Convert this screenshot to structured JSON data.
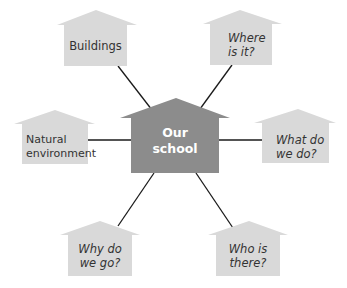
{
  "diagram": {
    "type": "mind-map",
    "colors": {
      "node_fill": "#d9d9d9",
      "center_fill": "#8c8c8c",
      "connector": "#1a1a1a",
      "node_text": "#333333",
      "center_text": "#ffffff"
    },
    "center": {
      "label_line1": "Our",
      "label_line2": "school"
    },
    "nodes": [
      {
        "id": "buildings",
        "label_line1": "Buildings",
        "label_line2": "",
        "italic": false
      },
      {
        "id": "where",
        "label_line1": "Where",
        "label_line2": "is it?",
        "italic": true
      },
      {
        "id": "natural",
        "label_line1": "Natural",
        "label_line2": "environment",
        "italic": false
      },
      {
        "id": "what",
        "label_line1": "What do",
        "label_line2": "we do?",
        "italic": true
      },
      {
        "id": "why",
        "label_line1": "Why do",
        "label_line2": "we go?",
        "italic": true
      },
      {
        "id": "who",
        "label_line1": "Who is",
        "label_line2": "there?",
        "italic": true
      }
    ]
  }
}
